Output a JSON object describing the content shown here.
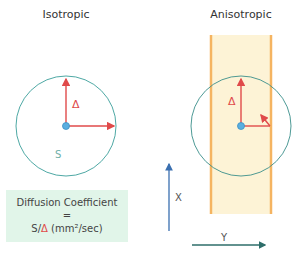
{
  "panels": {
    "isotropic": {
      "title": "Isotropic",
      "area_label": "S",
      "delta_label": "Δ"
    },
    "anisotropic": {
      "title": "Anisotropic",
      "delta_label": "Δ"
    }
  },
  "formula": {
    "line1": "Diffusion Coefficient",
    "line2": "=",
    "prefix": "S/",
    "delta": "Δ",
    "units": " (mm²/sec)"
  },
  "axes": {
    "x_label": "X",
    "y_label": "Y"
  },
  "colors": {
    "circle": "#3a9e9a",
    "arrow": "#e04a4a",
    "center_dot": "#5aaee0",
    "band_fill": "#fdf3d6",
    "band_edge": "#f5b461",
    "axis_arrow": "#3a6fb0",
    "box_fill": "#e1f5e9"
  }
}
